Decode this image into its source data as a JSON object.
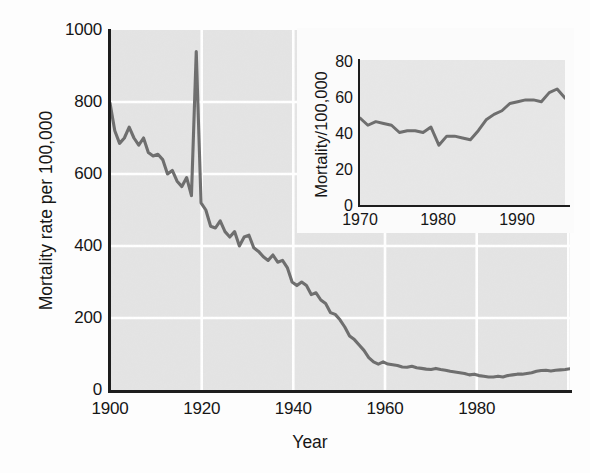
{
  "figure": {
    "background_color": "#fdfdfd",
    "plot_background_color": "#e4e4e4",
    "gridline_color": "#ffffff",
    "line_color": "#6e6e6e",
    "axis_color": "#1d1d1d"
  },
  "main": {
    "ylabel": "Mortality rate per 100,000",
    "xlabel": "Year",
    "yticks": [
      "0",
      "200",
      "400",
      "600",
      "800",
      "1000"
    ],
    "xticks": [
      "1900",
      "1920",
      "1940",
      "1960",
      "1980"
    ]
  },
  "inset": {
    "ylabel": "Mortality/100,000",
    "yticks": [
      "0",
      "20",
      "40",
      "60",
      "80"
    ],
    "xticks": [
      "1970",
      "1980",
      "1990"
    ]
  },
  "chart_data": [
    {
      "type": "line",
      "id": "main-chart",
      "title": "",
      "xlabel": "Year",
      "ylabel": "Mortality rate per 100,000",
      "xlim": [
        1900,
        1996
      ],
      "ylim": [
        0,
        1000
      ],
      "xticks": [
        1900,
        1920,
        1940,
        1960,
        1980
      ],
      "yticks": [
        0,
        200,
        400,
        600,
        800,
        1000
      ],
      "grid": true,
      "legend": null,
      "series": [
        {
          "name": "Infectious disease mortality rate",
          "color": "#6e6e6e",
          "x": [
            1900,
            1901,
            1902,
            1903,
            1904,
            1905,
            1906,
            1907,
            1908,
            1909,
            1910,
            1911,
            1912,
            1913,
            1914,
            1915,
            1916,
            1917,
            1918,
            1919,
            1920,
            1921,
            1922,
            1923,
            1924,
            1925,
            1926,
            1927,
            1928,
            1929,
            1930,
            1931,
            1932,
            1933,
            1934,
            1935,
            1936,
            1937,
            1938,
            1939,
            1940,
            1941,
            1942,
            1943,
            1944,
            1945,
            1946,
            1947,
            1948,
            1949,
            1950,
            1951,
            1952,
            1953,
            1954,
            1955,
            1956,
            1957,
            1958,
            1959,
            1960,
            1961,
            1962,
            1963,
            1964,
            1965,
            1966,
            1967,
            1968,
            1969,
            1970,
            1971,
            1972,
            1973,
            1974,
            1975,
            1976,
            1977,
            1978,
            1979,
            1980,
            1981,
            1982,
            1983,
            1984,
            1985,
            1986,
            1987,
            1988,
            1989,
            1990,
            1991,
            1992,
            1993,
            1994,
            1995,
            1996
          ],
          "y": [
            797,
            720,
            685,
            700,
            730,
            700,
            680,
            700,
            660,
            650,
            655,
            640,
            600,
            610,
            580,
            565,
            590,
            540,
            940,
            520,
            500,
            455,
            450,
            470,
            440,
            425,
            440,
            400,
            425,
            430,
            395,
            385,
            370,
            360,
            375,
            355,
            360,
            340,
            300,
            290,
            300,
            290,
            265,
            270,
            250,
            240,
            215,
            210,
            195,
            175,
            150,
            140,
            125,
            110,
            90,
            78,
            72,
            78,
            72,
            70,
            68,
            64,
            63,
            66,
            62,
            60,
            58,
            57,
            60,
            57,
            55,
            52,
            50,
            48,
            46,
            42,
            44,
            40,
            38,
            36,
            36,
            38,
            36,
            40,
            42,
            44,
            44,
            46,
            48,
            52,
            54,
            55,
            53,
            55,
            56,
            57,
            59
          ]
        }
      ]
    },
    {
      "type": "line",
      "id": "inset-chart",
      "title": "",
      "xlabel": "",
      "ylabel": "Mortality/100,000",
      "xlim": [
        1970,
        1996
      ],
      "ylim": [
        0,
        80
      ],
      "xticks": [
        1970,
        1980,
        1990
      ],
      "yticks": [
        0,
        20,
        40,
        60,
        80
      ],
      "grid": false,
      "legend": null,
      "series": [
        {
          "name": "Infectious disease mortality rate (1970-1996)",
          "color": "#6e6e6e",
          "x": [
            1970,
            1971,
            1972,
            1973,
            1974,
            1975,
            1976,
            1977,
            1978,
            1979,
            1980,
            1981,
            1982,
            1983,
            1984,
            1985,
            1986,
            1987,
            1988,
            1989,
            1990,
            1991,
            1992,
            1993,
            1994,
            1995,
            1996
          ],
          "y": [
            48,
            44,
            46,
            45,
            44,
            40,
            41,
            41,
            40,
            43,
            33,
            38,
            38,
            37,
            36,
            41,
            47,
            50,
            52,
            56,
            57,
            58,
            58,
            57,
            62,
            64,
            59
          ]
        }
      ]
    }
  ]
}
